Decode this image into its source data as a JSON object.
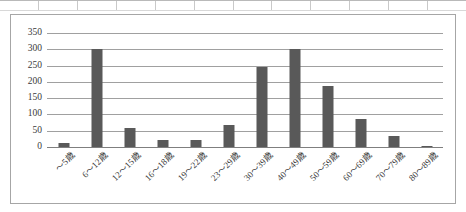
{
  "chart_data": {
    "type": "bar",
    "title": "",
    "xlabel": "",
    "ylabel": "",
    "categories": [
      "～5歳",
      "6～12歳",
      "12～15歳",
      "16～18歳",
      "19～22歳",
      "23～29歳",
      "30～39歳",
      "40～49歳",
      "50～59歳",
      "60～69歳",
      "70～79歳",
      "80～89歳"
    ],
    "values": [
      12,
      300,
      58,
      23,
      23,
      69,
      246,
      300,
      188,
      87,
      33,
      2
    ],
    "series": [
      {
        "name": "件数",
        "values": [
          12,
          300,
          58,
          23,
          23,
          69,
          246,
          300,
          188,
          87,
          33,
          2
        ]
      }
    ],
    "ylim": [
      0,
      350
    ],
    "yticks": [
      0,
      50,
      100,
      150,
      200,
      250,
      300,
      350
    ],
    "ytick_labels": [
      "0",
      "50",
      "100",
      "150",
      "200",
      "250",
      "300",
      "350"
    ],
    "grid": true,
    "legend": false,
    "bar_color": "#595959",
    "gridline_color": "#a0a0a0",
    "axis_label_color": "#3a3a3a",
    "frame_color": "#a6a6a6",
    "label_rotation_degrees": -45
  }
}
